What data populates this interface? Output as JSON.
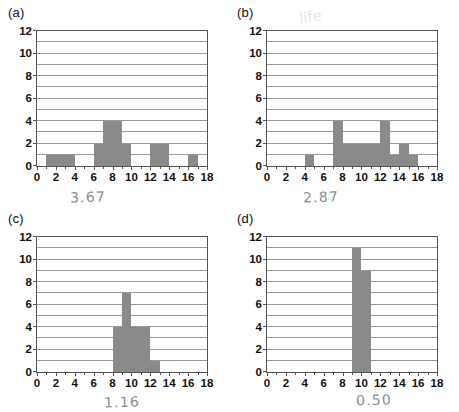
{
  "figure": {
    "panel_count": 4,
    "bar_color": "#8a8a8a",
    "grid_color": "#9a9a9a",
    "axis_color": "#555555",
    "annotation_color": "#6e7d86"
  },
  "panels": [
    {
      "key": "a",
      "label": "(a)",
      "annotation": "3.67",
      "smudge": "",
      "chart_data": {
        "type": "bar",
        "title": "(a)",
        "xlabel": "",
        "ylabel": "",
        "xlim": [
          0,
          18
        ],
        "ylim": [
          0,
          12
        ],
        "xticks": [
          0,
          2,
          4,
          6,
          8,
          10,
          12,
          14,
          16,
          18
        ],
        "yticks": [
          0,
          2,
          4,
          6,
          8,
          10,
          12
        ],
        "grid": true,
        "gridlines_at": [
          1,
          2,
          3,
          4,
          5,
          6,
          7,
          8,
          9,
          10,
          11,
          12
        ],
        "bins": [
          {
            "x0": 1,
            "x1": 4,
            "height": 1
          },
          {
            "x0": 6,
            "x1": 7,
            "height": 2
          },
          {
            "x0": 7,
            "x1": 9,
            "height": 4
          },
          {
            "x0": 9,
            "x1": 10,
            "height": 2
          },
          {
            "x0": 12,
            "x1": 14,
            "height": 2
          },
          {
            "x0": 16,
            "x1": 17,
            "height": 1
          }
        ]
      }
    },
    {
      "key": "b",
      "label": "(b)",
      "annotation": "2.87",
      "smudge": "life",
      "chart_data": {
        "type": "bar",
        "title": "(b)",
        "xlabel": "",
        "ylabel": "",
        "xlim": [
          0,
          18
        ],
        "ylim": [
          0,
          12
        ],
        "xticks": [
          0,
          2,
          4,
          6,
          8,
          10,
          12,
          14,
          16,
          18
        ],
        "yticks": [
          0,
          2,
          4,
          6,
          8,
          10,
          12
        ],
        "grid": true,
        "gridlines_at": [
          1,
          2,
          3,
          4,
          5,
          6,
          7,
          8,
          9,
          10,
          11,
          12
        ],
        "bins": [
          {
            "x0": 4,
            "x1": 5,
            "height": 1
          },
          {
            "x0": 7,
            "x1": 8,
            "height": 4
          },
          {
            "x0": 8,
            "x1": 12,
            "height": 2
          },
          {
            "x0": 12,
            "x1": 13,
            "height": 4
          },
          {
            "x0": 13,
            "x1": 14,
            "height": 1
          },
          {
            "x0": 14,
            "x1": 15,
            "height": 2
          },
          {
            "x0": 15,
            "x1": 16,
            "height": 1
          }
        ]
      }
    },
    {
      "key": "c",
      "label": "(c)",
      "annotation": "1.16",
      "smudge": "",
      "chart_data": {
        "type": "bar",
        "title": "(c)",
        "xlabel": "",
        "ylabel": "",
        "xlim": [
          0,
          18
        ],
        "ylim": [
          0,
          12
        ],
        "xticks": [
          0,
          2,
          4,
          6,
          8,
          10,
          12,
          14,
          16,
          18
        ],
        "yticks": [
          0,
          2,
          4,
          6,
          8,
          10,
          12
        ],
        "grid": true,
        "gridlines_at": [
          1,
          2,
          3,
          4,
          5,
          6,
          7,
          8,
          9,
          10,
          11,
          12
        ],
        "bins": [
          {
            "x0": 8,
            "x1": 9,
            "height": 4
          },
          {
            "x0": 9,
            "x1": 10,
            "height": 7
          },
          {
            "x0": 10,
            "x1": 12,
            "height": 4
          },
          {
            "x0": 12,
            "x1": 13,
            "height": 1
          }
        ]
      }
    },
    {
      "key": "d",
      "label": "(d)",
      "annotation": "0.50",
      "smudge": "",
      "chart_data": {
        "type": "bar",
        "title": "(d)",
        "xlabel": "",
        "ylabel": "",
        "xlim": [
          0,
          18
        ],
        "ylim": [
          0,
          12
        ],
        "xticks": [
          0,
          2,
          4,
          6,
          8,
          10,
          12,
          14,
          16,
          18
        ],
        "yticks": [
          0,
          2,
          4,
          6,
          8,
          10,
          12
        ],
        "grid": true,
        "gridlines_at": [
          1,
          2,
          3,
          4,
          5,
          6,
          7,
          8,
          9,
          10,
          11,
          12
        ],
        "bins": [
          {
            "x0": 9,
            "x1": 10,
            "height": 11
          },
          {
            "x0": 10,
            "x1": 11,
            "height": 9
          }
        ]
      }
    }
  ]
}
